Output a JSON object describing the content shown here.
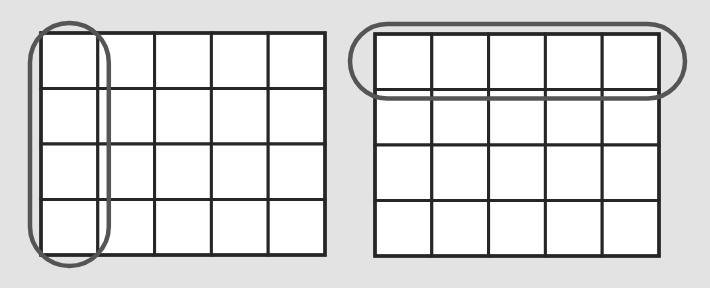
{
  "diagram": {
    "background_color": "#e3e3e3",
    "cell_fill": "#ffffff",
    "grid_line_color": "#262626",
    "highlight_color": "#555555",
    "grids": [
      {
        "id": "left-grid",
        "rows": 4,
        "cols": 5,
        "highlight": {
          "type": "column",
          "index": 0
        }
      },
      {
        "id": "right-grid",
        "rows": 4,
        "cols": 5,
        "highlight": {
          "type": "row",
          "index": 0
        }
      }
    ]
  }
}
